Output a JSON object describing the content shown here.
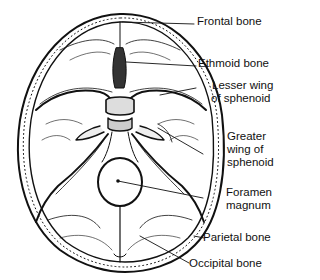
{
  "diagram": {
    "labels": [
      {
        "id": "frontal",
        "text": "Frontal bone"
      },
      {
        "id": "ethmoid",
        "text": "Ethmoid bone"
      },
      {
        "id": "lesser_wing_1",
        "text": "Lesser wing"
      },
      {
        "id": "lesser_wing_2",
        "text": "of sphenoid"
      },
      {
        "id": "greater_wing_1",
        "text": "Greater"
      },
      {
        "id": "greater_wing_2",
        "text": "wing of"
      },
      {
        "id": "greater_wing_3",
        "text": "sphenoid"
      },
      {
        "id": "foramen_1",
        "text": "Foramen"
      },
      {
        "id": "foramen_2",
        "text": "magnum"
      },
      {
        "id": "parietal",
        "text": "Parietal bone"
      },
      {
        "id": "occipital",
        "text": "Occipital bone"
      }
    ]
  }
}
